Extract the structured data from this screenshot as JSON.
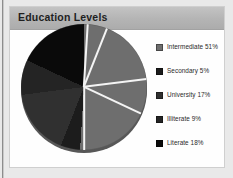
{
  "card": {
    "title": "Education Levels"
  },
  "legend": {
    "items": [
      {
        "label": "Intermediate 51%",
        "name": "Intermediate",
        "value": 51,
        "color": "#6e6e6e"
      },
      {
        "label": "Secondary 5%",
        "name": "Secondary",
        "value": 5,
        "color": "#1c1c1c"
      },
      {
        "label": "University 17%",
        "name": "University",
        "value": 17,
        "color": "#303030"
      },
      {
        "label": "Illiterate 9%",
        "name": "Illiterate",
        "value": 9,
        "color": "#242424"
      },
      {
        "label": "Literate 18%",
        "name": "Literate",
        "value": 18,
        "color": "#0a0a0a"
      }
    ]
  },
  "chart_data": {
    "type": "pie",
    "title": "Education Levels",
    "xlabel": "",
    "ylabel": "",
    "categories": [
      "Intermediate",
      "Secondary",
      "University",
      "Illiterate",
      "Literate"
    ],
    "values": [
      51,
      5,
      17,
      9,
      18
    ],
    "labels": [
      "Intermediate 51%",
      "Secondary 5%",
      "University 17%",
      "Illiterate 9%",
      "Literate 18%"
    ],
    "colors": [
      "#6e6e6e",
      "#1c1c1c",
      "#303030",
      "#242424",
      "#0a0a0a"
    ],
    "unit": "%",
    "start_angle": 0,
    "direction": "clockwise",
    "legend_position": "right",
    "grid": false,
    "separator_color": "#f4f4f4"
  },
  "theme": {
    "page_background": "#e9e9e9",
    "card_background": "#ffffff",
    "header_background": "#b4b4b4",
    "title_color": "#1f1f1f",
    "label_color": "#2a2a2a"
  }
}
